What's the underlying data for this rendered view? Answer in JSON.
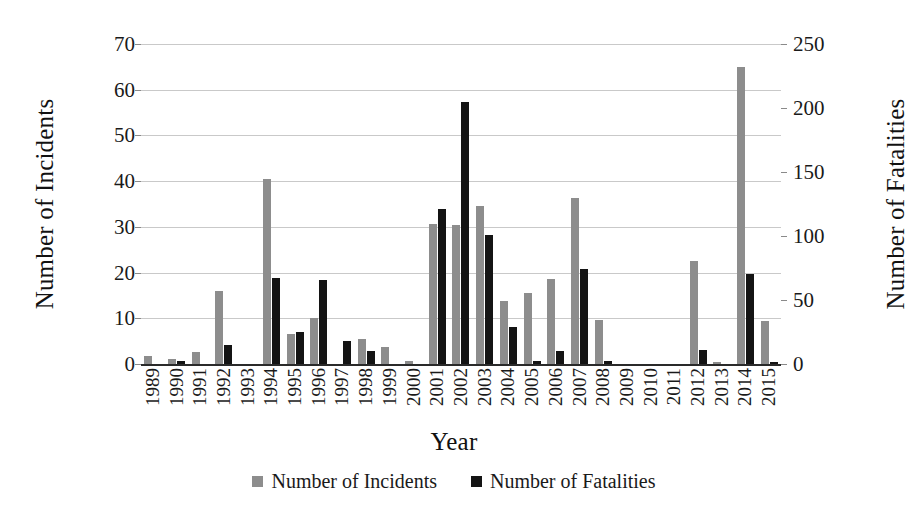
{
  "chart_data": {
    "type": "bar",
    "title": "",
    "xlabel": "Year",
    "ylabel": "Number of Incidents",
    "y2label": "Number of Fatalities",
    "grid": true,
    "legend_position": "bottom",
    "ylim": [
      0,
      70
    ],
    "y2lim": [
      0,
      250
    ],
    "yticks": [
      "0",
      "10",
      "20",
      "30",
      "40",
      "50",
      "60",
      "70"
    ],
    "y2ticks": [
      "0",
      "50",
      "100",
      "150",
      "200",
      "250"
    ],
    "categories": [
      "1989",
      "1990",
      "1991",
      "1992",
      "1993",
      "1994",
      "1995",
      "1996",
      "1997",
      "1998",
      "1999",
      "2000",
      "2001",
      "2002",
      "2003",
      "2004",
      "2005",
      "2006",
      "2007",
      "2008",
      "2009",
      "2010",
      "2011",
      "2012",
      "2013",
      "2014",
      "2015"
    ],
    "series": [
      {
        "name": "Number of Incidents",
        "axis": "left",
        "color": "#8d8d8d",
        "values": [
          1.8,
          1.2,
          2.6,
          16.0,
          0,
          40.5,
          6.5,
          10.0,
          0,
          5.5,
          3.8,
          0.6,
          30.7,
          30.5,
          34.5,
          13.7,
          15.5,
          18.7,
          36.3,
          9.7,
          0,
          0,
          0,
          22.5,
          0.4,
          65.0,
          9.5
        ]
      },
      {
        "name": "Number of Fatalities",
        "axis": "right",
        "color": "#141414",
        "values": [
          0,
          2,
          0,
          15,
          0,
          67,
          25,
          66,
          18,
          10,
          0,
          0,
          121,
          205,
          101,
          29,
          2.5,
          10,
          74,
          2.5,
          0,
          0,
          0,
          11,
          0,
          70,
          1.5
        ]
      }
    ]
  },
  "legend": {
    "items": [
      {
        "label": "Number of Incidents",
        "color": "#8d8d8d"
      },
      {
        "label": "Number of Fatalities",
        "color": "#141414"
      }
    ]
  }
}
